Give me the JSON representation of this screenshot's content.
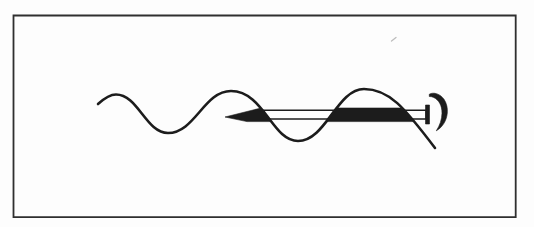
{
  "figure": {
    "kind": "scanned-line-drawing",
    "visible_text": ""
  },
  "palette": {
    "paper": "#fdfdfd",
    "ink": "#1c1c1c",
    "frame": "#2f2f2f",
    "speck": "#bdbdbd"
  },
  "drawing": {
    "canvas": {
      "width": "534",
      "height": "227",
      "viewbox": "0 0 534 227"
    },
    "frame": {
      "d": "M 13.5,15.5 H 515.7 V 217.2 H 13.5 Z"
    },
    "wave": {
      "d": "M 98,104 C 103,99.5 109,94.5 116,94.5 C 138,94.5 146,133 168,133 C 195,133 204,91 231,91 C 264,91 272,141 298,141 C 326,141 337,89 364,89 C 389,89 404,107 435,148"
    },
    "shaft": {
      "d": "M 256,110.2 H 426.2 V 119 H 256 Z"
    },
    "arrowhead_segment": {
      "d": "M 225,117 L 261,108 L 271,121.6 L 247,121.6 Z"
    },
    "mid_filled_segment": {
      "d": "M 325.7,121.6 L 336,108 L 401,108 L 414,121.6 Z"
    },
    "tail_bar": {
      "d": "M 425.5,105 H 429.5 V 124 H 425.5 Z"
    },
    "rotation_hook": {
      "d": "M 429.3,94.2 C 433.5,91.8 440.5,93.8 444.2,99.6 C 446.6,103.4 447.8,108.3 447.3,113 C 446.7,120 443,127 436.3,130.8 C 439.8,125.6 441.9,119.3 442,113.2 C 442.1,105.6 438.9,99.8 433.6,97.4 C 432.2,96.8 430.7,96.4 429.3,96.5 Z"
    },
    "scan_speck": {
      "d": "M 391.5,41 L 396,37.5"
    }
  }
}
